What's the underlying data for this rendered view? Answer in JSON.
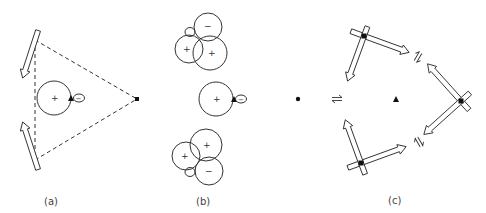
{
  "figure": {
    "panels": [
      {
        "id": "a",
        "label": "(a)",
        "signs": {
          "main_lobe": "+",
          "small_lobe": "−"
        },
        "description": "Three atoms at triangle vertices joined by dashed lines; p-orbital with lobes at center; displacement arrows on two left vertices"
      },
      {
        "id": "b",
        "label": "(b)",
        "signs": {
          "top_cluster": [
            "−",
            "+",
            "+"
          ],
          "middle": [
            "+",
            "−"
          ],
          "bottom_cluster": [
            "+",
            "+",
            "−"
          ]
        },
        "description": "Orbital lobe combinations: top cluster, middle single orbital, bottom cluster"
      },
      {
        "id": "c",
        "label": "(c)",
        "description": "Three crossed double-arrow displacement nodes around a central triangle marker, with equilibrium symbols between them"
      }
    ],
    "colors": {
      "stroke": "#333333",
      "background": "#ffffff"
    }
  }
}
